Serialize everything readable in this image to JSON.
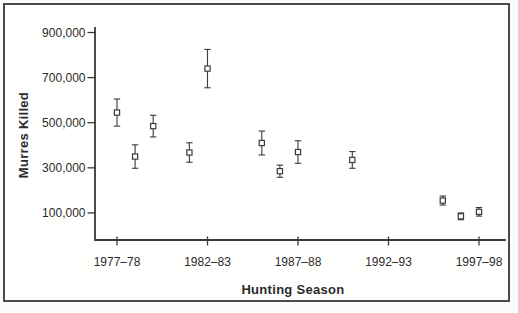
{
  "figure": {
    "background": "#fbfbf9",
    "frame_color": "#4a4a4a"
  },
  "chart_data": {
    "type": "scatter",
    "title": "",
    "xlabel": "Hunting Season",
    "ylabel": "Murres Killed",
    "legend": null,
    "grid": false,
    "x_axis": {
      "ticks": [
        {
          "label": "1977–78",
          "season_index": 0
        },
        {
          "label": "1982–83",
          "season_index": 5
        },
        {
          "label": "1987–88",
          "season_index": 10
        },
        {
          "label": "1992–93",
          "season_index": 15
        },
        {
          "label": "1997–98",
          "season_index": 20
        }
      ]
    },
    "y_axis": {
      "ticks": [
        {
          "label": "100,000",
          "value": 100000
        },
        {
          "label": "300,000",
          "value": 300000
        },
        {
          "label": "500,000",
          "value": 500000
        },
        {
          "label": "700,000",
          "value": 700000
        },
        {
          "label": "900,000",
          "value": 900000
        }
      ],
      "range": [
        -20000,
        920000
      ]
    },
    "series": [
      {
        "name": "Estimated murre harvest with error bars",
        "marker": "open-square",
        "error_bars": true,
        "points": [
          {
            "season": "1977–78",
            "season_index": 0,
            "value": 545000,
            "error": 60000
          },
          {
            "season": "1978–79",
            "season_index": 1,
            "value": 350000,
            "error": 52000
          },
          {
            "season": "1979–80",
            "season_index": 2,
            "value": 485000,
            "error": 48000
          },
          {
            "season": "1981–82",
            "season_index": 4,
            "value": 368000,
            "error": 43000
          },
          {
            "season": "1982–83",
            "season_index": 5,
            "value": 740000,
            "error": 85000
          },
          {
            "season": "1985–86",
            "season_index": 8,
            "value": 410000,
            "error": 53000
          },
          {
            "season": "1986–87",
            "season_index": 9,
            "value": 285000,
            "error": 27000
          },
          {
            "season": "1987–88",
            "season_index": 10,
            "value": 370000,
            "error": 50000
          },
          {
            "season": "1990–91",
            "season_index": 13,
            "value": 335000,
            "error": 37000
          },
          {
            "season": "1995–96",
            "season_index": 18,
            "value": 155000,
            "error": 20000
          },
          {
            "season": "1996–97",
            "season_index": 19,
            "value": 85000,
            "error": 15000
          },
          {
            "season": "1997–98",
            "season_index": 20,
            "value": 105000,
            "error": 19000
          }
        ]
      }
    ],
    "colors": {
      "ink": "#3a3a3a",
      "marker_fill": "#ffffff",
      "text": "#2b2b2b"
    }
  }
}
